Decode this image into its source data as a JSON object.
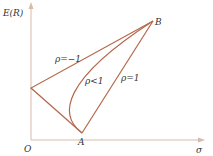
{
  "axes": {
    "y_label": "E(R)",
    "x_label": "σ",
    "origin_label": "O",
    "axis_color": "#d9b9a8"
  },
  "points": {
    "A": "A",
    "B": "B"
  },
  "curves": {
    "neg_one": "ρ=−1",
    "less_one": "ρ<1",
    "one": "ρ=1",
    "line_color": "#b5674a"
  }
}
